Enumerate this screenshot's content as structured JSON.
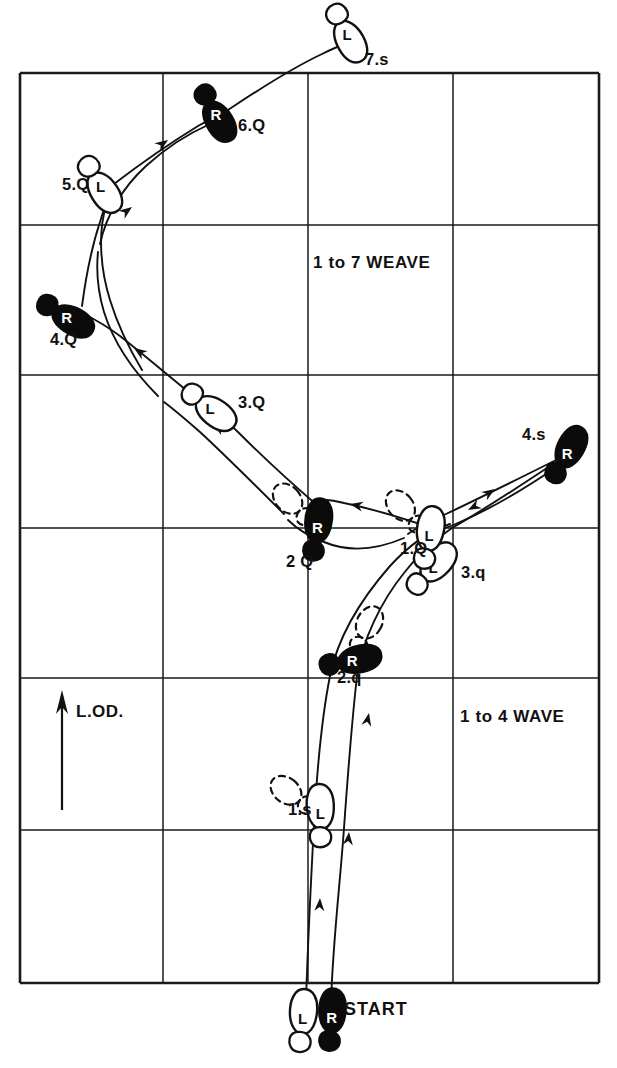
{
  "diagram": {
    "title_visible": false,
    "background_color": "#ffffff",
    "ink_color": "#111111",
    "grid": {
      "left": 20,
      "top": 73,
      "right": 599,
      "bottom": 983,
      "columns": 4,
      "rows": 6,
      "x_lines": [
        20,
        163,
        308,
        453,
        599
      ],
      "y_lines": [
        73,
        225,
        375,
        528,
        678,
        830,
        983
      ]
    },
    "section_labels": [
      {
        "id": "weave",
        "text": "1 to 7 WEAVE",
        "x": 313,
        "y": 268
      },
      {
        "id": "wave",
        "text": "1 to 4 WAVE",
        "x": 460,
        "y": 722
      }
    ],
    "lod": {
      "text": "L.OD.",
      "label_x": 76,
      "label_y": 717,
      "arrow_x": 62,
      "arrow_top_y": 690,
      "arrow_bottom_y": 810
    },
    "start": {
      "text": "START",
      "label_x": 344,
      "label_y": 1015,
      "left_foot": {
        "letter": "L",
        "fill": "open",
        "x": 303,
        "y": 1013
      },
      "right_foot": {
        "letter": "R",
        "fill": "solid",
        "x": 332,
        "y": 1012
      }
    },
    "steps": [
      {
        "id": "wave-1s",
        "label": "1.s",
        "label_x": 288,
        "label_y": 815,
        "foot": "L",
        "fill": "open",
        "x": 320,
        "y": 808,
        "rotation": -4,
        "ghost": true
      },
      {
        "id": "wave-2q",
        "label": "2.q",
        "label_x": 337,
        "label_y": 683,
        "foot": "R",
        "fill": "solid",
        "x": 358,
        "y": 659,
        "rotation": 76,
        "ghost": true
      },
      {
        "id": "wave-3q",
        "label": "3.q",
        "label_x": 461,
        "label_y": 578,
        "foot": "L",
        "fill": "open",
        "x": 437,
        "y": 563,
        "rotation": 40,
        "ghost": false
      },
      {
        "id": "wave-4s",
        "label": "4.s",
        "label_x": 522,
        "label_y": 440,
        "foot": "R",
        "fill": "solid",
        "x": 570,
        "y": 448,
        "rotation": 27,
        "ghost": false
      },
      {
        "id": "weave-1q",
        "label": "1.Q",
        "label_x": 400,
        "label_y": 554,
        "foot": "L",
        "fill": "open",
        "x": 430,
        "y": 530,
        "rotation": 8,
        "ghost": true
      },
      {
        "id": "weave-2q",
        "label": "2 Q",
        "label_x": 286,
        "label_y": 567,
        "foot": "R",
        "fill": "solid",
        "x": 318,
        "y": 522,
        "rotation": 6,
        "ghost": true
      },
      {
        "id": "weave-3q",
        "label": "3.Q",
        "label_x": 238,
        "label_y": 408,
        "foot": "L",
        "fill": "open",
        "x": 215,
        "y": 412,
        "rotation": 125,
        "ghost": false
      },
      {
        "id": "weave-4q",
        "label": "4.Q",
        "label_x": 50,
        "label_y": 345,
        "foot": "R",
        "fill": "solid",
        "x": 72,
        "y": 320,
        "rotation": 118,
        "ghost": false
      },
      {
        "id": "weave-5q",
        "label": "5.Q",
        "label_x": 62,
        "label_y": 190,
        "foot": "L",
        "fill": "open",
        "x": 104,
        "y": 191,
        "rotation": 145,
        "ghost": false
      },
      {
        "id": "weave-6q",
        "label": "6.Q",
        "label_x": 238,
        "label_y": 131,
        "foot": "R",
        "fill": "solid",
        "x": 219,
        "y": 120,
        "rotation": 148,
        "ghost": false
      },
      {
        "id": "weave-7s",
        "label": "7.s",
        "label_x": 365,
        "label_y": 65,
        "foot": "L",
        "fill": "open",
        "x": 350,
        "y": 40,
        "rotation": 150,
        "ghost": false
      }
    ],
    "tracks": [
      {
        "id": "wave-track-right",
        "d": "M 331 1002 C 333 940 340 885 344 828 C 348 772 352 720 357 676 C 362 640 382 600 404 573 C 420 552 440 536 452 528"
      },
      {
        "id": "wave-track-left",
        "d": "M 306 1000 C 308 940 311 880 314 824 C 317 770 322 716 330 676 C 338 636 362 598 390 566 C 412 542 432 530 450 524"
      },
      {
        "id": "wave-to-4s",
        "d": "M 452 528 C 480 512 520 486 556 462"
      },
      {
        "id": "weave-4s-to-1q",
        "d": "M 558 466 C 520 492 488 510 460 522 C 452 526 446 528 440 529"
      },
      {
        "id": "weave-1q-to-2q",
        "d": "M 426 526 C 396 516 368 508 344 503 C 336 501 330 500 326 500"
      },
      {
        "id": "weave-2q-to-3q",
        "d": "M 318 506 C 290 482 262 456 240 434 C 228 422 220 416 214 412"
      },
      {
        "id": "weave-3q-to-4q",
        "d": "M 206 406 C 178 384 148 358 120 336 C 104 324 92 318 84 314"
      },
      {
        "id": "weave-4q-to-5q",
        "d": "M 82 306 C 86 276 92 246 100 222 C 104 208 108 198 110 192"
      },
      {
        "id": "weave-5q-to-6q",
        "d": "M 114 184 C 140 164 172 142 198 126 C 208 120 214 118 218 116"
      },
      {
        "id": "weave-6q-to-7s",
        "d": "M 228 110 C 258 90 292 68 322 54 C 334 48 342 45 348 43"
      },
      {
        "id": "weave-inner-1",
        "d": "M 556 460 C 516 480 476 500 446 514 C 428 522 416 528 408 534"
      },
      {
        "id": "weave-inner-2",
        "d": "M 404 538 C 376 550 348 552 324 542 C 308 536 296 528 288 520"
      },
      {
        "id": "weave-inner-3",
        "d": "M 284 514 C 256 486 226 456 200 432 C 184 418 172 408 164 402"
      },
      {
        "id": "weave-inner-4",
        "d": "M 158 396 C 134 372 114 344 104 312 C 98 292 96 272 98 252"
      },
      {
        "id": "weave-inner-5",
        "d": "M 100 244 C 106 216 122 188 146 166 C 168 146 192 132 210 124"
      },
      {
        "id": "weave-loop-5q",
        "d": "M 106 206 C 98 232 100 268 110 300 C 118 326 130 350 142 370"
      }
    ],
    "direction_arrows": [
      {
        "id": "arrow-wave-up-1",
        "x": 320,
        "y": 898,
        "angle": -87
      },
      {
        "id": "arrow-wave-up-2",
        "x": 349,
        "y": 832,
        "angle": -85
      },
      {
        "id": "arrow-wave-up-3",
        "x": 369,
        "y": 713,
        "angle": -78
      },
      {
        "id": "arrow-4s-in",
        "x": 495,
        "y": 489,
        "angle": -33
      },
      {
        "id": "arrow-1q-in",
        "x": 468,
        "y": 510,
        "angle": 152
      },
      {
        "id": "arrow-2q-in",
        "x": 350,
        "y": 504,
        "angle": 192
      },
      {
        "id": "arrow-3q-in",
        "x": 213,
        "y": 424,
        "angle": 213
      },
      {
        "id": "arrow-4q-in",
        "x": 134,
        "y": 348,
        "angle": 215
      },
      {
        "id": "arrow-5q-in",
        "x": 132,
        "y": 207,
        "angle": 323
      },
      {
        "id": "arrow-6q-in",
        "x": 168,
        "y": 140,
        "angle": 325
      }
    ]
  }
}
